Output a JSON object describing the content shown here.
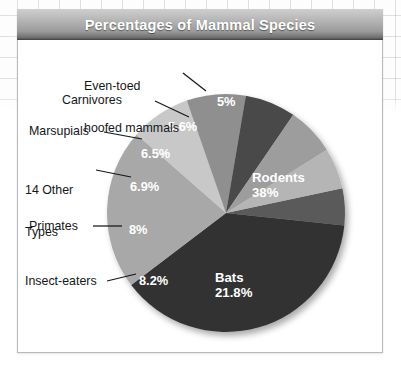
{
  "figure": {
    "title": "Percentages of Mammal Species",
    "background_grid": true,
    "card_border_color": "#b9b9bd",
    "title_bar_color": "#9b9b9b",
    "title_text_color": "#ffffff"
  },
  "chart_data": {
    "type": "pie",
    "title": "Percentages of Mammal Species",
    "xlabel": "",
    "ylabel": "",
    "legend_position": "none",
    "grid": false,
    "value_unit": "%",
    "total": 100,
    "start_angle_deg": -12,
    "direction": "clockwise",
    "center": {
      "x": 226,
      "y": 213
    },
    "radius": 119,
    "labels": [
      "Even-toed hoofed mammals",
      "Rodents",
      "Bats",
      "Insect-eaters",
      "Primates",
      "14 Other Types",
      "Marsupials",
      "Carnivores"
    ],
    "values": [
      5,
      38,
      21.8,
      8.2,
      8,
      6.9,
      6.5,
      5.6
    ],
    "value_labels": [
      "5%",
      "38%",
      "21.8%",
      "8.2%",
      "8%",
      "6.9%",
      "6.5%",
      "5.6%"
    ],
    "colors": [
      "#5a5a5a",
      "#333333",
      "#a8a8a8",
      "#c8c8c8",
      "#8f8f8f",
      "#4a4a4a",
      "#9d9d9d",
      "#b5b5b5"
    ],
    "slices": [
      {
        "label": "Even-toed hoofed mammals",
        "value": 5,
        "value_label": "5%",
        "color": "#5a5a5a",
        "label_placement": "external",
        "pct_placement": "internal"
      },
      {
        "label": "Rodents",
        "value": 38,
        "value_label": "38%",
        "color": "#333333",
        "label_placement": "internal",
        "pct_placement": "internal"
      },
      {
        "label": "Bats",
        "value": 21.8,
        "value_label": "21.8%",
        "color": "#a8a8a8",
        "label_placement": "internal",
        "pct_placement": "internal"
      },
      {
        "label": "Insect-eaters",
        "value": 8.2,
        "value_label": "8.2%",
        "color": "#c8c8c8",
        "label_placement": "external",
        "pct_placement": "internal"
      },
      {
        "label": "Primates",
        "value": 8,
        "value_label": "8%",
        "color": "#8f8f8f",
        "label_placement": "external",
        "pct_placement": "internal"
      },
      {
        "label": "14 Other Types",
        "value": 6.9,
        "value_label": "6.9%",
        "color": "#4a4a4a",
        "label_placement": "external",
        "pct_placement": "internal"
      },
      {
        "label": "Marsupials",
        "value": 6.5,
        "value_label": "6.5%",
        "color": "#9d9d9d",
        "label_placement": "external",
        "pct_placement": "internal"
      },
      {
        "label": "Carnivores",
        "value": 5.6,
        "value_label": "5.6%",
        "color": "#b5b5b5",
        "label_placement": "external",
        "pct_placement": "internal"
      }
    ]
  },
  "callouts": {
    "even_toed_line1": "Even-toed",
    "even_toed_line2": "hoofed mammals",
    "carnivores": "Carnivores",
    "marsupials": "Marsupials",
    "other_line1": "14 Other",
    "other_line2": "Types",
    "primates": "Primates",
    "insect_eaters": "Insect-eaters"
  },
  "internal_labels": {
    "rodents_name": "Rodents",
    "rodents_pct": "38%",
    "bats_name": "Bats",
    "bats_pct": "21.8%",
    "even_toed_pct": "5%",
    "carnivores_pct": "5.6%",
    "marsupials_pct": "6.5%",
    "other_pct": "6.9%",
    "primates_pct": "8%",
    "insect_pct": "8.2%"
  }
}
